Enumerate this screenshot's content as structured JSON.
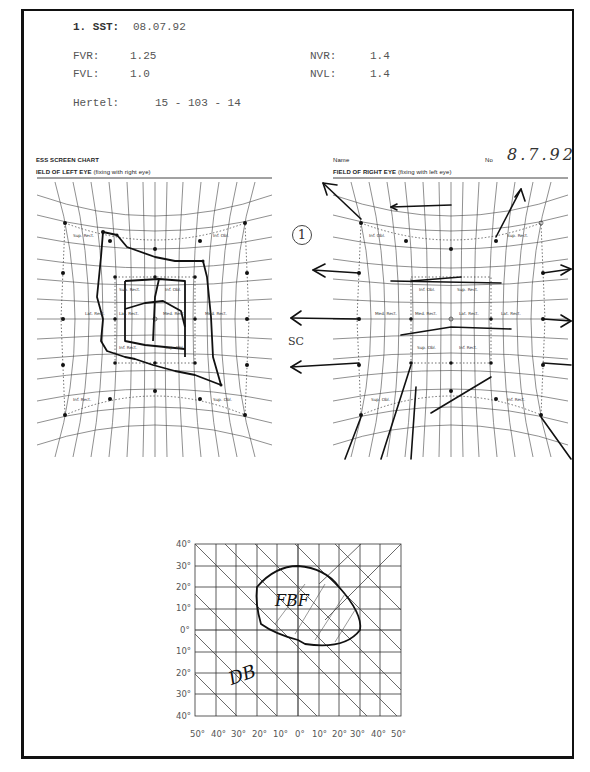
{
  "header": {
    "sst_label": "1. SST:",
    "sst_value": "08.07.92",
    "fvr_label": "FVR:",
    "fvr_value": "1.25",
    "fvl_label": "FVL:",
    "fvl_value": "1.0",
    "nvr_label": "NVR:",
    "nvr_value": "1.4",
    "nvl_label": "NVL:",
    "nvl_value": "1.4",
    "hertel_label": "Hertel:",
    "hertel_value": "15 - 103 - 14"
  },
  "hess_chart": {
    "title": "ESS SCREEN CHART",
    "name_label": "Name",
    "no_label": "No",
    "handwritten_date": "8.7.92",
    "left_field": {
      "title": "IELD OF LEFT EYE",
      "subtitle": "(fixing with right eye)",
      "muscle_labels": [
        "Sup. Rect.",
        "Inf. Obl.",
        "Sup. Rect.",
        "Inf. Obl.",
        "Lat. Rect.",
        "Lat. Rect.",
        "Med. Rect.",
        "Med. Rect.",
        "Inf. Rect.",
        "Sup. Obl.",
        "Inf. Rect.",
        "Sup. Obl."
      ]
    },
    "right_field": {
      "title": "FIELD OF RIGHT EYE",
      "subtitle": "(fixing with left eye)",
      "muscle_labels": [
        "Inf. Obl.",
        "Sup. Rect.",
        "Inf. Obl.",
        "Sup. Rect.",
        "Med. Rect.",
        "Med. Rect.",
        "Lat. Rect.",
        "Lat. Rect.",
        "Sup. Obl.",
        "Inf. Rect.",
        "Sup. Obl.",
        "Inf. Rect."
      ]
    },
    "annotation_circle": "1",
    "annotation_sc": "SC"
  },
  "binocular_field": {
    "y_ticks": [
      "40°",
      "30°",
      "20°",
      "10°",
      "0°",
      "10°",
      "20°",
      "30°",
      "40°"
    ],
    "x_ticks": [
      "50°",
      "40°",
      "30°",
      "20°",
      "10°",
      "0°",
      "10°",
      "20°",
      "30°",
      "40°",
      "50°"
    ],
    "label_fbf": "FBF",
    "label_db": "DB"
  }
}
